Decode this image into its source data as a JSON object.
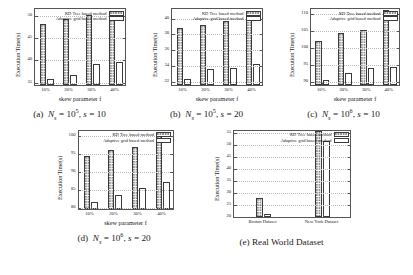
{
  "figure": {
    "legend": {
      "kd_label": "KD Tree based method",
      "adaptive_label": "Adaptive grid based method"
    },
    "captions": {
      "a": "(a)  N_s = 10^5, s = 10",
      "b": "(b)  N_s = 10^5, s = 20",
      "c": "(c)  N_s = 10^6, s = 10",
      "d": "(d)  N_s = 10^6, s = 20",
      "e": "(e)  Real World Dataset"
    },
    "caption_parts": {
      "a": {
        "tag": "(a)",
        "n_sym": "N",
        "n_sub": "s",
        "eq": "=",
        "base": "10",
        "exp": "5",
        "comma": ",",
        "s_sym": "s",
        "s_eq": "=",
        "s_val": "10"
      },
      "b": {
        "tag": "(b)",
        "n_sym": "N",
        "n_sub": "s",
        "eq": "=",
        "base": "10",
        "exp": "5",
        "comma": ",",
        "s_sym": "s",
        "s_eq": "=",
        "s_val": "20"
      },
      "c": {
        "tag": "(c)",
        "n_sym": "N",
        "n_sub": "s",
        "eq": "=",
        "base": "10",
        "exp": "6",
        "comma": ",",
        "s_sym": "s",
        "s_eq": "=",
        "s_val": "10"
      },
      "d": {
        "tag": "(d)",
        "n_sym": "N",
        "n_sub": "s",
        "eq": "=",
        "base": "10",
        "exp": "6",
        "comma": ",",
        "s_sym": "s",
        "s_eq": "=",
        "s_val": "20"
      },
      "e": {
        "tag": "(e)",
        "text": "Real World Dataset"
      }
    }
  },
  "chart_data": [
    {
      "id": "a",
      "type": "bar",
      "title": "",
      "caption": "(a) Ns = 10^5, s = 10",
      "xlabel": "skew parameter f",
      "ylabel": "Execution Time(s)",
      "categories": [
        "10%",
        "20%",
        "30%",
        "40%"
      ],
      "ylim": [
        34,
        51.5
      ],
      "yticks": [
        35,
        40,
        45,
        50
      ],
      "ytick_labels": [
        "35",
        "40",
        "45",
        "50"
      ],
      "grid": true,
      "legend_position": "top-right",
      "series": [
        {
          "name": "KD Tree based method",
          "values": [
            47.6,
            48.8,
            49.6,
            50.4
          ]
        },
        {
          "name": "Adaptive grid based method",
          "values": [
            35.4,
            36.2,
            38.7,
            39.1
          ]
        }
      ]
    },
    {
      "id": "b",
      "type": "bar",
      "title": "",
      "caption": "(b) Ns = 10^5, s = 20",
      "xlabel": "skew parameter f",
      "ylabel": "Execution Time(s)",
      "categories": [
        "10%",
        "20%",
        "30%",
        "40%"
      ],
      "ylim": [
        31.4,
        41.2
      ],
      "yticks": [
        32,
        34,
        36,
        38,
        40
      ],
      "ytick_labels": [
        "32",
        "34",
        "36",
        "38",
        "40"
      ],
      "grid": true,
      "legend_position": "top-right",
      "series": [
        {
          "name": "KD Tree based method",
          "values": [
            38.6,
            39.0,
            39.5,
            40.4
          ]
        },
        {
          "name": "Adaptive grid based method",
          "values": [
            32.2,
            33.4,
            33.6,
            34.0
          ]
        }
      ]
    },
    {
      "id": "c",
      "type": "bar",
      "title": "",
      "caption": "(c) Ns = 10^6, s = 10",
      "xlabel": "skew parameter f",
      "ylabel": "Execution Time(s)",
      "categories": [
        "10%",
        "20%",
        "30%",
        "40%"
      ],
      "ylim": [
        88.6,
        111.5
      ],
      "yticks": [
        90,
        95,
        100,
        105,
        110
      ],
      "ytick_labels": [
        "90",
        "95",
        "100",
        "105",
        "110"
      ],
      "grid": true,
      "legend_position": "top-right",
      "series": [
        {
          "name": "KD Tree based method",
          "values": [
            101.5,
            103.8,
            104.7,
            110.5
          ]
        },
        {
          "name": "Adaptive grid based method",
          "values": [
            90.2,
            92.2,
            93.6,
            93.8
          ]
        }
      ]
    },
    {
      "id": "d",
      "type": "bar",
      "title": "",
      "caption": "(d) Ns = 10^6, s = 20",
      "xlabel": "skew parameter f",
      "ylabel": "Execution Time(s)",
      "categories": [
        "10%",
        "20%",
        "30%",
        "40%"
      ],
      "ylim": [
        79.2,
        101.5
      ],
      "yticks": [
        80,
        85,
        90,
        95,
        100
      ],
      "ytick_labels": [
        "80",
        "85",
        "90",
        "95",
        "100"
      ],
      "grid": true,
      "legend_position": "top-right",
      "series": [
        {
          "name": "KD Tree based method",
          "values": [
            94.0,
            95.6,
            96.4,
            100.4
          ]
        },
        {
          "name": "Adaptive grid based method",
          "values": [
            81.0,
            83.0,
            85.0,
            86.6
          ]
        }
      ]
    },
    {
      "id": "e",
      "type": "bar",
      "title": "",
      "caption": "(e) Real World Dataset",
      "xlabel": "",
      "ylabel": "Execution Time(s)",
      "categories": [
        "Boston Dataset",
        "New York Dataset"
      ],
      "ylim": [
        19.2,
        56.0
      ],
      "yticks": [
        20,
        25,
        30,
        35,
        40,
        45,
        50,
        55
      ],
      "ytick_labels": [
        "20",
        "25",
        "30",
        "35",
        "40",
        "45",
        "50",
        "55"
      ],
      "grid": true,
      "legend_position": "top-right",
      "series": [
        {
          "name": "KD Tree based method",
          "values": [
            27.0,
            55.0
          ]
        },
        {
          "name": "Adaptive grid based method",
          "values": [
            20.3,
            51.0
          ]
        }
      ]
    }
  ]
}
